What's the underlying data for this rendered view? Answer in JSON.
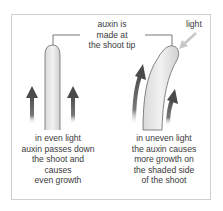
{
  "diagram": {
    "type": "phototropism auxin diagram",
    "center_label": [
      "auxin is",
      "made at",
      "the shoot tip"
    ],
    "light_label": "light",
    "left_panel": {
      "shoot_shape": "straight",
      "caption": [
        "in even light",
        "auxin passes down",
        "the shoot and",
        "causes",
        "even growth"
      ],
      "arrows": "two equal upward arrows on both sides"
    },
    "right_panel": {
      "shoot_shape": "bent toward light",
      "caption": [
        "in uneven light",
        "the auxin causes",
        "more growth on",
        "the shaded side",
        "of the shoot"
      ],
      "arrows": "longer upward arrow on shaded (left) side, shorter on lit (right) side"
    },
    "colors": {
      "arrow": "#555555",
      "shoot_fill": "#e6e6e6",
      "shoot_outline": "#777777",
      "light_arrow": "#c8c8c8",
      "frame": "#cfcfcf"
    }
  }
}
